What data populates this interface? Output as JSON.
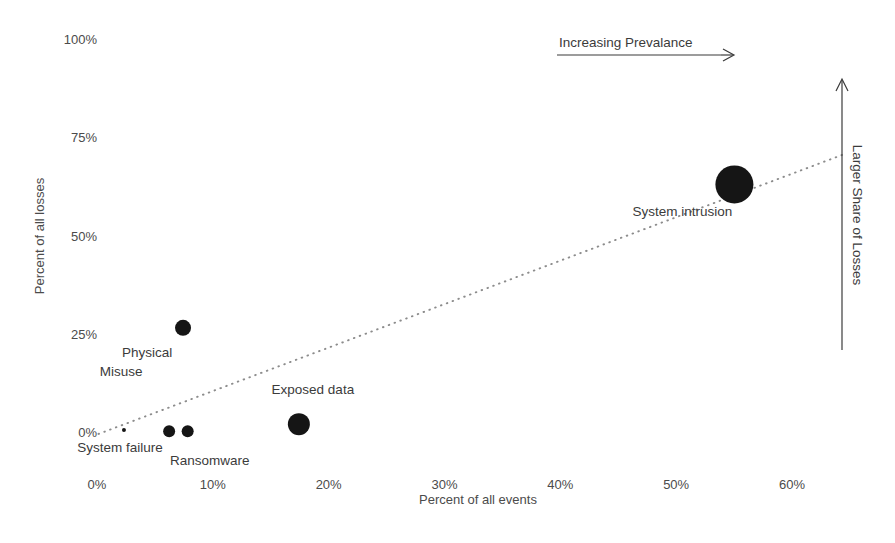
{
  "chart_data": {
    "type": "scatter",
    "title": "",
    "xlabel": "Percent of all events",
    "ylabel": "Percent of all losses",
    "xlim": [
      -1,
      65
    ],
    "ylim": [
      -4,
      103
    ],
    "grid": false,
    "legend": "none",
    "x_ticks": [
      "0%",
      "10%",
      "20%",
      "30%",
      "40%",
      "50%",
      "60%"
    ],
    "x_tick_values": [
      0,
      10,
      20,
      30,
      40,
      50,
      60
    ],
    "y_ticks": [
      "0%",
      "25%",
      "50%",
      "75%",
      "100%"
    ],
    "y_tick_values": [
      0,
      25,
      50,
      75,
      100
    ],
    "points": [
      {
        "label": "System failure",
        "x": 2.5,
        "y": 0.5,
        "size": 2,
        "label_dx": -4,
        "label_dy": 22,
        "label_anchor": "middle"
      },
      {
        "label": "Physical",
        "x": 7.6,
        "y": 26.5,
        "size": 8,
        "label_dx": -36,
        "label_dy": 29,
        "label_anchor": "middle"
      },
      {
        "label": "Misuse",
        "x": 6.4,
        "y": 0.2,
        "size": 6,
        "label_dx": -48,
        "label_dy": -55,
        "label_anchor": "middle"
      },
      {
        "label": "Ransomware",
        "x": 8.0,
        "y": 0.2,
        "size": 6,
        "label_dx": 22,
        "label_dy": 34,
        "label_anchor": "middle"
      },
      {
        "label": "Exposed data",
        "x": 17.6,
        "y": 2.0,
        "size": 11,
        "label_dx": 14,
        "label_dy": -30,
        "label_anchor": "middle"
      },
      {
        "label": "System intrusion",
        "x": 55.2,
        "y": 63.0,
        "size": 19,
        "label_dx": -52,
        "label_dy": 32,
        "label_anchor": "middle"
      }
    ],
    "trendline": {
      "x_start": 0.3,
      "y_start": -0.5,
      "x_end": 64.5,
      "y_end": 70.5
    },
    "annotations": [
      {
        "name": "increasing-prevalance",
        "text": "Increasing Prevalance",
        "orientation": "horizontal"
      },
      {
        "name": "larger-share-of-losses",
        "text": "Larger Share of Losses",
        "orientation": "vertical"
      }
    ],
    "footer_caption": ""
  },
  "annotations": {
    "prevalance": "Increasing Prevalance",
    "losses": "Larger Share of Losses"
  }
}
